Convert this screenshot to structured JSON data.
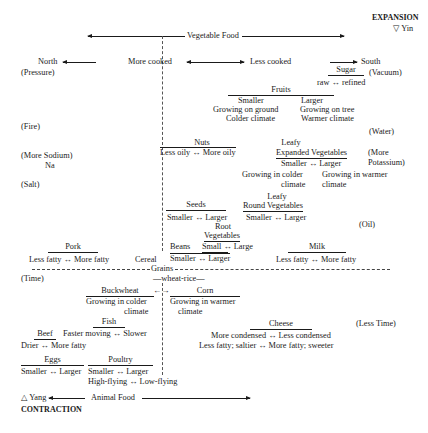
{
  "top": {
    "expansion": "EXPANSION",
    "yin": "▽ Yin",
    "vegetable_food": "Vegetable Food"
  },
  "bottom": {
    "yang": "△ Yang",
    "contraction": "CONTRACTION",
    "animal_food": "Animal Food"
  },
  "directions": {
    "north": "North",
    "more_cooked": "More cooked",
    "less_cooked": "Less cooked",
    "south": "South"
  },
  "left_labels": {
    "pressure": "(Pressure)",
    "fire": "(Fire)",
    "more_sodium": "(More Sodium)",
    "na": "Na",
    "salt": "(Salt)",
    "time": "(Time)"
  },
  "right_labels": {
    "vacuum": "(Vacuum)",
    "water": "(Water)",
    "more_potassium_1": "(More",
    "more_potassium_2": "Potassium)",
    "oil": "(Oil)",
    "less_time": "(Less Time)"
  },
  "sugar": {
    "title": "Sugar",
    "range": "raw ↔ refined"
  },
  "fruits": {
    "title": "Fruits",
    "smaller": "Smaller",
    "larger": "Larger",
    "smaller_1": "Growing on ground",
    "smaller_2": "Colder climate",
    "larger_1": "Growing on tree",
    "larger_2": "Warmer climate"
  },
  "nuts": {
    "title": "Nuts",
    "range": "Less oily ↔ More oily"
  },
  "leafy_expanded": {
    "title_1": "Leafy",
    "title_2": "Expanded Vegetables",
    "range": "Smaller ↔ Larger",
    "left_1": "Growing in colder",
    "left_2": "climate",
    "right_1": "Growing in warmer",
    "right_2": "climate"
  },
  "seeds": {
    "title": "Seeds",
    "range": "Smaller ↔ Larger"
  },
  "leafy_round": {
    "title_1": "Leafy",
    "title_2": "Round Vegetables",
    "range": "Smaller ↔ Larger"
  },
  "root_veg": {
    "title_1": "Root",
    "title_2": "Vegetables",
    "range": "Small ↔ Large"
  },
  "beans": {
    "title": "Beans",
    "range": "Smaller ↔ Larger"
  },
  "milk": {
    "title": "Milk",
    "range": "Less fatty ↔ More fatty"
  },
  "pork": {
    "title": "Pork",
    "range": "Less fatty ↔ More fatty"
  },
  "cereal": "Cereal",
  "grains": "Grains",
  "wheat_rice": "—wheat-rice—",
  "buckwheat": {
    "title": "Buckwheat",
    "line_1": "Growing in colder",
    "line_2": "climate",
    "arrow": "←→"
  },
  "corn": {
    "title": "Corn",
    "line_1": "Growing in warmer",
    "line_2": "climate"
  },
  "fish": {
    "title": "Fish",
    "range": "Faster moving ↔ Slower"
  },
  "beef": {
    "title": "Beef",
    "range": "Drier ↔ More fatty"
  },
  "cheese": {
    "title": "Cheese",
    "range_1": "More condensed ↔ Less condensed",
    "range_2": "Less fatty; saltier ↔ More fatty; sweeter"
  },
  "eggs": {
    "title": "Eggs",
    "range": "Smaller ↔ Larger"
  },
  "poultry": {
    "title": "Poultry",
    "range_1": "Smaller ↔ Larger",
    "range_2": "High-flying ↔ Low-flying"
  }
}
